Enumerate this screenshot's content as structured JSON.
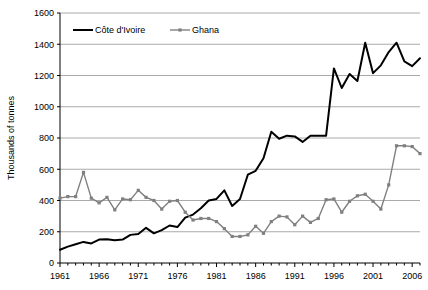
{
  "chart_data": {
    "type": "line",
    "title": "",
    "subtitle": "",
    "xlabel": "",
    "ylabel": "Thousands of tonnes",
    "xlim": [
      1961,
      2007
    ],
    "ylim": [
      0,
      1600
    ],
    "ytick_step": 200,
    "yticks": [
      0,
      200,
      400,
      600,
      800,
      1000,
      1200,
      1400,
      1600
    ],
    "xticks_labeled": [
      1961,
      1966,
      1971,
      1976,
      1981,
      1986,
      1991,
      1996,
      2001,
      2006
    ],
    "xtick_step_minor": 1,
    "grid": "horizontal",
    "legend_position": "top-left-inside",
    "x": [
      1961,
      1962,
      1963,
      1964,
      1965,
      1966,
      1967,
      1968,
      1969,
      1970,
      1971,
      1972,
      1973,
      1974,
      1975,
      1976,
      1977,
      1978,
      1979,
      1980,
      1981,
      1982,
      1983,
      1984,
      1985,
      1986,
      1987,
      1988,
      1989,
      1990,
      1991,
      1992,
      1993,
      1994,
      1995,
      1996,
      1997,
      1998,
      1999,
      2000,
      2001,
      2002,
      2003,
      2004,
      2005,
      2006,
      2007
    ],
    "series": [
      {
        "name": "Côte d'Ivoire",
        "color": "#000000",
        "marker": "none",
        "line_width": 2,
        "values": [
          85,
          105,
          120,
          135,
          125,
          150,
          152,
          145,
          150,
          180,
          185,
          225,
          190,
          210,
          240,
          230,
          290,
          310,
          350,
          400,
          410,
          465,
          365,
          410,
          565,
          590,
          670,
          840,
          795,
          815,
          810,
          775,
          815,
          815,
          815,
          1245,
          1120,
          1210,
          1165,
          1410,
          1215,
          1265,
          1350,
          1410,
          1290,
          1260,
          1310
        ]
      },
      {
        "name": "Ghana",
        "color": "#808080",
        "marker": "square",
        "line_width": 1.4,
        "values": [
          415,
          425,
          425,
          580,
          415,
          385,
          420,
          340,
          410,
          405,
          465,
          420,
          400,
          345,
          395,
          400,
          325,
          275,
          285,
          285,
          265,
          220,
          170,
          170,
          180,
          235,
          190,
          265,
          300,
          295,
          245,
          300,
          260,
          285,
          405,
          410,
          325,
          395,
          430,
          440,
          395,
          345,
          500,
          750,
          750,
          745,
          700
        ]
      }
    ],
    "legend": [
      {
        "label": "Côte d'Ivoire",
        "color": "#000000",
        "style": "line"
      },
      {
        "label": "Ghana",
        "color": "#808080",
        "style": "line-marker"
      }
    ],
    "axis_color": "#000000",
    "grid_color": "#aaaaaa",
    "background": "#ffffff"
  }
}
